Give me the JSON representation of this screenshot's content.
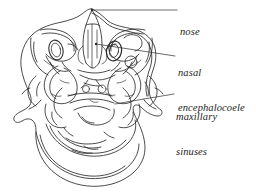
{
  "figure": {
    "type": "anatomical-line-drawing",
    "background_color": "#ffffff",
    "ink_color": "#2b2b2b",
    "labels": [
      {
        "id": "nose",
        "text": "nose",
        "lines": [
          "nose"
        ],
        "leader": {
          "from_x": 92,
          "from_y": 10,
          "to_x": 177,
          "to_y": 10
        }
      },
      {
        "id": "nasal-encephalocoele",
        "text": "nasal encephalocoele",
        "lines": [
          "nasal",
          "encephalocoele"
        ],
        "leader": {
          "from_x": 96,
          "from_y": 44,
          "to_x": 175,
          "to_y": 56
        }
      },
      {
        "id": "maxillary-sinuses",
        "text": "maxillary sinuses",
        "lines": [
          "maxillary",
          "sinuses"
        ],
        "leader": {
          "from_x": 144,
          "from_y": 99,
          "to_x": 174,
          "to_y": 94
        }
      }
    ]
  }
}
